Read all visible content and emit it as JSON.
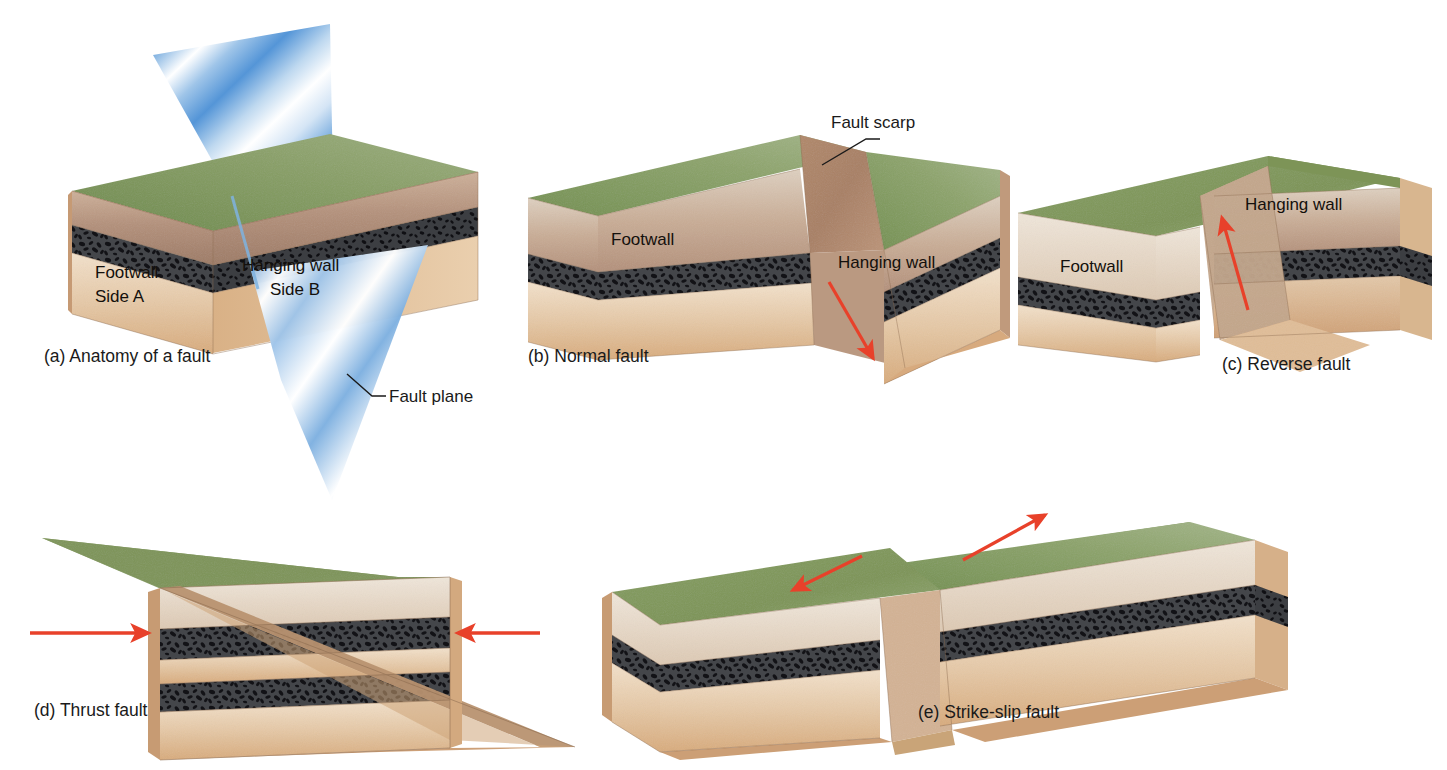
{
  "figure": {
    "background_color": "#ffffff"
  },
  "palette": {
    "grass_green_light": "#93a86a",
    "grass_green_dark": "#6f8a4e",
    "soil_brown_light": "#c9a88b",
    "soil_brown_dark": "#9e7a62",
    "conglomerate_dark": "#3b3b3d",
    "conglomerate_clast": "#15151a",
    "sand_tan_light": "#efdcc4",
    "sand_tan_dark": "#d8b187",
    "pale_cream": "#e8ded2",
    "fault_plane_blue": "#4a8fd4",
    "fault_plane_highlight": "#ffffff",
    "arrow_red": "#e8412a",
    "leader_line": "#1a1a1a",
    "edge_line": "#8a6a4e"
  },
  "panels": [
    {
      "id": "a",
      "caption": "(a) Anatomy of a fault",
      "labels": [
        {
          "name": "footwall",
          "text": "Footwall"
        },
        {
          "name": "side-a",
          "text": "Side A"
        },
        {
          "name": "hanging-wall",
          "text": "Hanging wall"
        },
        {
          "name": "side-b",
          "text": "Side B"
        }
      ],
      "callouts": [
        {
          "name": "fault-plane",
          "text": "Fault plane"
        }
      ],
      "arrows": []
    },
    {
      "id": "b",
      "caption": "(b) Normal fault",
      "labels": [
        {
          "name": "footwall",
          "text": "Footwall"
        },
        {
          "name": "hanging-wall",
          "text": "Hanging wall"
        }
      ],
      "callouts": [
        {
          "name": "fault-scarp",
          "text": "Fault scarp"
        }
      ],
      "arrows": [
        {
          "name": "slip-arrow-down",
          "direction": "down-right",
          "color": "#e8412a"
        }
      ]
    },
    {
      "id": "c",
      "caption": "(c) Reverse fault",
      "labels": [
        {
          "name": "footwall",
          "text": "Footwall"
        },
        {
          "name": "hanging-wall",
          "text": "Hanging wall"
        }
      ],
      "callouts": [],
      "arrows": [
        {
          "name": "slip-arrow-up",
          "direction": "up-left",
          "color": "#e8412a"
        }
      ]
    },
    {
      "id": "d",
      "caption": "(d) Thrust fault",
      "labels": [],
      "callouts": [],
      "arrows": [
        {
          "name": "compression-arrow-left",
          "direction": "right",
          "color": "#e8412a"
        },
        {
          "name": "compression-arrow-right",
          "direction": "left",
          "color": "#e8412a"
        }
      ]
    },
    {
      "id": "e",
      "caption": "(e) Strike-slip fault",
      "labels": [],
      "callouts": [],
      "arrows": [
        {
          "name": "shear-arrow-near",
          "direction": "down-left",
          "color": "#e8412a"
        },
        {
          "name": "shear-arrow-far",
          "direction": "up-right",
          "color": "#e8412a"
        }
      ]
    }
  ],
  "strata": [
    {
      "name": "grass-surface",
      "label": "vegetated ground surface",
      "color": "#7d9457"
    },
    {
      "name": "upper-soil",
      "label": "brown soil / sandstone",
      "color": "#b9967a"
    },
    {
      "name": "conglomerate-bed",
      "label": "dark conglomerate marker bed",
      "color": "#3b3b3d"
    },
    {
      "name": "lower-sandstone",
      "label": "pale sandstone",
      "color": "#e3c9a8"
    }
  ]
}
